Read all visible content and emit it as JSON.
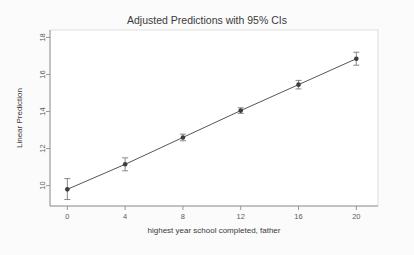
{
  "chart_data": {
    "type": "line",
    "title": "Adjusted Predictions with 95% CIs",
    "xlabel": "highest year school completed, father",
    "ylabel": "Linear Prediction",
    "x": [
      0,
      4,
      8,
      12,
      16,
      20
    ],
    "values": [
      9.8,
      11.15,
      12.6,
      14.05,
      15.45,
      16.85
    ],
    "ci_lower": [
      9.25,
      10.8,
      12.42,
      13.9,
      15.22,
      16.5
    ],
    "ci_upper": [
      10.38,
      11.5,
      12.78,
      14.2,
      15.68,
      17.2
    ],
    "series": [
      {
        "name": "Linear Prediction",
        "values": [
          9.8,
          11.15,
          12.6,
          14.05,
          15.45,
          16.85
        ]
      }
    ],
    "xlim": [
      -1.2,
      21.5
    ],
    "ylim": [
      8.9,
      18.4
    ],
    "xticks": [
      0,
      4,
      8,
      12,
      16,
      20
    ],
    "yticks": [
      10,
      12,
      14,
      16,
      18
    ],
    "xtick_labels": [
      "0",
      "4",
      "8",
      "12",
      "16",
      "20"
    ],
    "ytick_labels": [
      "10",
      "12",
      "14",
      "16",
      "18"
    ],
    "grid": false,
    "legend": false,
    "legend_position": "none",
    "marker": "circle",
    "line_color": "#55555a",
    "marker_color": "#3c3c42",
    "ci_color": "#7a7a80",
    "plot_border_color": "#d8d8d8",
    "axis_color": "#8c8c8c",
    "background_color": "#fbfbfb",
    "plot_background_color": "#ffffff"
  }
}
